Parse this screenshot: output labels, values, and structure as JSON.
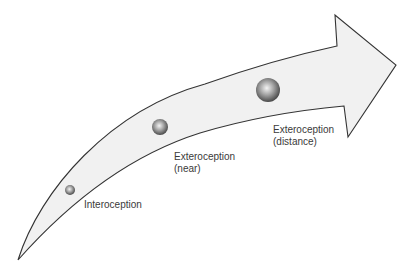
{
  "diagram": {
    "type": "curved-arrow-progression",
    "colors": {
      "arrow_fill": "#f1f1f1",
      "arrow_stroke": "#333333",
      "sphere_highlight": "#f2f2f2",
      "sphere_mid": "#9a9a9a",
      "sphere_edge": "#4a4a4a",
      "text": "#3a3a3a"
    },
    "stages": [
      {
        "id": "interoception",
        "line1": "Interoception",
        "line2": "",
        "sphere": {
          "cx": 70,
          "cy": 190,
          "r": 5
        },
        "label_pos": {
          "x": 84,
          "y": 199
        }
      },
      {
        "id": "exteroception-near",
        "line1": "Exteroception",
        "line2": "(near)",
        "sphere": {
          "cx": 160,
          "cy": 127,
          "r": 8
        },
        "label_pos": {
          "x": 174,
          "y": 151
        }
      },
      {
        "id": "exteroception-distance",
        "line1": "Exteroception",
        "line2": "(distance)",
        "sphere": {
          "cx": 268,
          "cy": 90,
          "r": 12
        },
        "label_pos": {
          "x": 273,
          "y": 124
        }
      }
    ]
  }
}
